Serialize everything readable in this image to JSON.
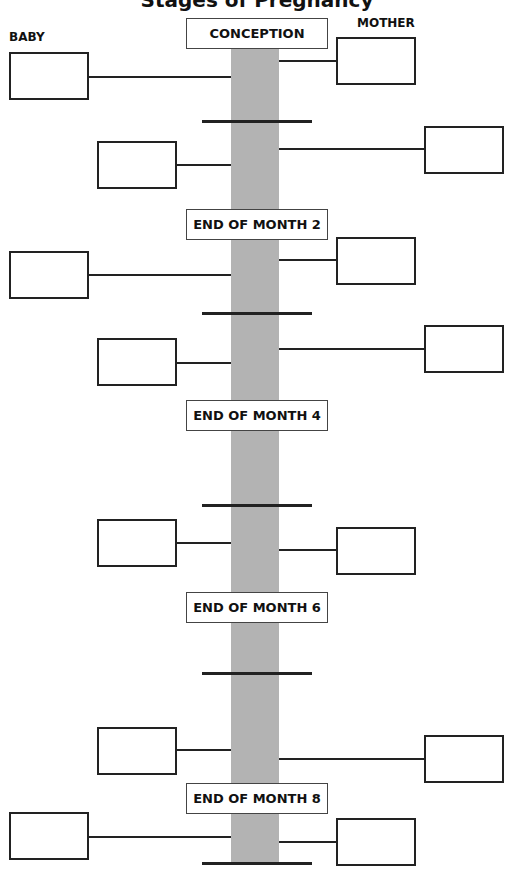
{
  "title": "Stages of Pregnancy",
  "columns": {
    "baby": "BABY",
    "mother": "MOTHER"
  },
  "milestones": [
    {
      "label": "CONCEPTION"
    },
    {
      "label": "END OF MONTH 2"
    },
    {
      "label": "END OF MONTH 4"
    },
    {
      "label": "END OF MONTH 6"
    },
    {
      "label": "END OF MONTH 8"
    }
  ],
  "colors": {
    "bar": "#b3b3b3",
    "line": "#222222"
  }
}
